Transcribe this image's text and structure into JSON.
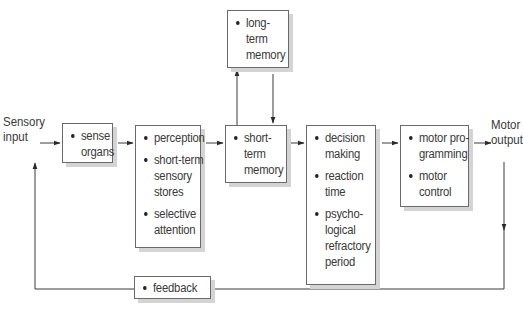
{
  "diagram": {
    "type": "information-processing-flow",
    "input_label_line1": "Sensory",
    "input_label_line2": "input",
    "output_label_line1": "Motor",
    "output_label_line2": "output",
    "boxes": {
      "sense_organs": {
        "items": [
          "sense organs"
        ],
        "lines": [
          [
            "sense",
            "organs"
          ]
        ]
      },
      "perception": {
        "items": [
          "perception",
          "short-term sensory stores",
          "selective attention"
        ],
        "lines": [
          [
            "perception"
          ],
          [
            "short-term",
            "sensory",
            "stores"
          ],
          [
            "selective",
            "attention"
          ]
        ]
      },
      "short_term_memory": {
        "items": [
          "short-term memory"
        ],
        "lines": [
          [
            "short-",
            "term",
            "memory"
          ]
        ]
      },
      "long_term_memory": {
        "items": [
          "long-term memory"
        ],
        "lines": [
          [
            "long-",
            "term",
            "memory"
          ]
        ]
      },
      "decision": {
        "items": [
          "decision making",
          "reaction time",
          "psychological refractory period"
        ],
        "lines": [
          [
            "decision",
            "making"
          ],
          [
            "reaction",
            "time"
          ],
          [
            "psycho-",
            "logical",
            "refractory",
            "period"
          ]
        ]
      },
      "motor": {
        "items": [
          "motor programming",
          "motor control"
        ],
        "lines": [
          [
            "motor pro-",
            "gramming"
          ],
          [
            "motor",
            "control"
          ]
        ]
      },
      "feedback": {
        "items": [
          "feedback"
        ],
        "lines": [
          [
            "feedback"
          ]
        ]
      }
    },
    "connections": [
      {
        "from": "Sensory input",
        "to": "sense organs"
      },
      {
        "from": "sense organs",
        "to": "perception"
      },
      {
        "from": "perception",
        "to": "short-term memory"
      },
      {
        "from": "short-term memory",
        "to": "long-term memory"
      },
      {
        "from": "long-term memory",
        "to": "short-term memory"
      },
      {
        "from": "short-term memory",
        "to": "decision making"
      },
      {
        "from": "decision making",
        "to": "motor programming"
      },
      {
        "from": "motor programming",
        "to": "Motor output"
      },
      {
        "from": "Motor output",
        "to": "feedback"
      },
      {
        "from": "feedback",
        "to": "Sensory input"
      }
    ],
    "colors": {
      "line": "#3a3a3a",
      "box_border": "#6a6a6a",
      "shadow": "#d4d4d4",
      "text": "#3a3a3a"
    }
  }
}
